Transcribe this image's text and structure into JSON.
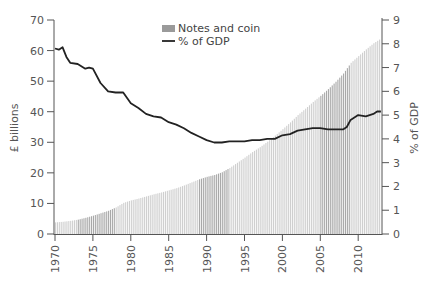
{
  "chart_data": {
    "type": "bar+line",
    "title": "",
    "legend": [
      {
        "label": "Notes and coin",
        "type": "bar",
        "color": "#aaaaaa"
      },
      {
        "label": "% of GDP",
        "type": "line",
        "color": "#222222"
      }
    ],
    "ylabel_left": "£ billions",
    "ylabel_right": "% of GDP",
    "ylim_left": [
      0,
      70
    ],
    "ylim_right": [
      0,
      9
    ],
    "yticks_left": [
      0,
      10,
      20,
      30,
      40,
      50,
      60,
      70
    ],
    "yticks_right": [
      0,
      1,
      2,
      3,
      4,
      5,
      6,
      7,
      8,
      9
    ],
    "xticks": [
      "1970",
      "1975",
      "1980",
      "1985",
      "1990",
      "1995",
      "2000",
      "2005",
      "2010"
    ],
    "x_range": [
      1970,
      2013
    ],
    "bar_series": {
      "name": "Notes and coin",
      "x": [
        1970,
        1971,
        1972,
        1973,
        1974,
        1975,
        1976,
        1977,
        1978,
        1979,
        1980,
        1981,
        1982,
        1983,
        1984,
        1985,
        1986,
        1987,
        1988,
        1989,
        1990,
        1991,
        1992,
        1993,
        1994,
        1995,
        1996,
        1997,
        1998,
        1999,
        2000,
        2001,
        2002,
        2003,
        2004,
        2005,
        2006,
        2007,
        2008,
        2009,
        2010,
        2011,
        2012,
        2013
      ],
      "values": [
        3.8,
        4.0,
        4.3,
        4.7,
        5.3,
        6.0,
        6.8,
        7.6,
        8.7,
        10.2,
        11.0,
        11.6,
        12.3,
        13.0,
        13.6,
        14.3,
        15.0,
        15.9,
        16.9,
        17.9,
        18.7,
        19.3,
        20.2,
        21.6,
        23.3,
        25.0,
        26.8,
        28.4,
        30.2,
        32.2,
        34.3,
        36.5,
        38.9,
        41.0,
        43.2,
        45.2,
        47.4,
        49.8,
        52.5,
        56.0,
        58.2,
        60.4,
        62.4,
        64.0
      ],
      "shade_bands": [
        [
          1973,
          1978
        ],
        [
          1989,
          1993
        ],
        [
          2005,
          2009
        ]
      ]
    },
    "line_series": {
      "name": "% of GDP",
      "x": [
        1970,
        1970.5,
        1971,
        1971.5,
        1972,
        1973,
        1974,
        1974.5,
        1975,
        1976,
        1977,
        1978,
        1979,
        1980,
        1981,
        1982,
        1983,
        1984,
        1985,
        1986,
        1987,
        1988,
        1989,
        1990,
        1991,
        1992,
        1993,
        1994,
        1995,
        1996,
        1997,
        1998,
        1999,
        2000,
        2001,
        2002,
        2003,
        2004,
        2005,
        2006,
        2007,
        2008,
        2008.5,
        2009,
        2010,
        2011,
        2012,
        2012.5,
        2013
      ],
      "values": [
        7.8,
        7.75,
        7.85,
        7.45,
        7.2,
        7.15,
        6.95,
        7.0,
        6.95,
        6.35,
        6.0,
        5.95,
        5.95,
        5.5,
        5.3,
        5.05,
        4.95,
        4.9,
        4.7,
        4.6,
        4.45,
        4.25,
        4.1,
        3.95,
        3.85,
        3.85,
        3.9,
        3.9,
        3.9,
        3.95,
        3.95,
        4.0,
        4.0,
        4.15,
        4.2,
        4.35,
        4.4,
        4.45,
        4.45,
        4.4,
        4.4,
        4.4,
        4.5,
        4.8,
        5.0,
        4.95,
        5.05,
        5.15,
        5.15
      ]
    },
    "grid": false,
    "legend_position": "top-center"
  }
}
